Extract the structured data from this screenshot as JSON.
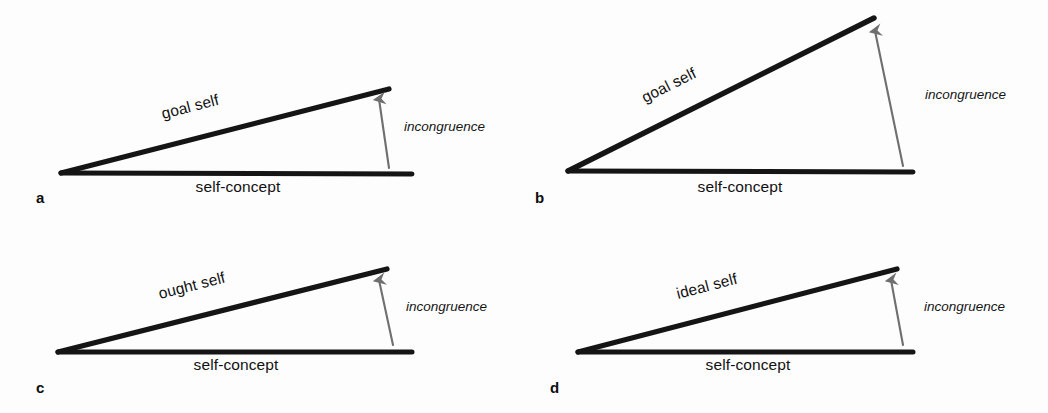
{
  "figure": {
    "background_color": "#fdfdfd",
    "line_color": "#151515",
    "arrow_color": "#6f6f6f",
    "text_color": "#111111"
  },
  "panels": [
    {
      "letter": "a",
      "upper_label": "goal self",
      "base_label": "self-concept",
      "arrow_label": "incongruence",
      "geometry": {
        "vertex": [
          61,
          173
        ],
        "apex": [
          389,
          89
        ],
        "base_right": [
          412,
          174
        ],
        "slope_deg": -14.4,
        "arrow_tail": [
          389,
          168
        ],
        "arrow_tip": [
          379,
          96
        ]
      },
      "letter_pos": [
        36,
        203
      ],
      "upper_label_pos": [
        163,
        119
      ],
      "base_label_pos": [
        238,
        192
      ],
      "arrow_label_pos": [
        404,
        131
      ]
    },
    {
      "letter": "b",
      "upper_label": "goal self",
      "base_label": "self-concept",
      "arrow_label": "incongruence",
      "geometry": {
        "vertex": [
          568,
          171
        ],
        "apex": [
          874,
          18
        ],
        "base_right": [
          913,
          172
        ],
        "slope_deg": -26.6,
        "arrow_tail": [
          903,
          166
        ],
        "arrow_tip": [
          874,
          27
        ]
      },
      "letter_pos": [
        535,
        203
      ],
      "upper_label_pos": [
        645,
        103
      ],
      "base_label_pos": [
        740,
        192
      ],
      "arrow_label_pos": [
        925,
        99
      ]
    },
    {
      "letter": "c",
      "upper_label": "ought self",
      "base_label": "self-concept",
      "arrow_label": "incongruence",
      "geometry": {
        "vertex": [
          58,
          352
        ],
        "apex": [
          387,
          269
        ],
        "base_right": [
          412,
          352
        ],
        "slope_deg": -14.2,
        "arrow_tail": [
          393,
          345
        ],
        "arrow_tip": [
          379,
          277
        ]
      },
      "letter_pos": [
        36,
        393
      ],
      "upper_label_pos": [
        160,
        299
      ],
      "base_label_pos": [
        236,
        370
      ],
      "arrow_label_pos": [
        406,
        311
      ]
    },
    {
      "letter": "d",
      "upper_label": "ideal self",
      "base_label": "self-concept",
      "arrow_label": "incongruence",
      "geometry": {
        "vertex": [
          578,
          352
        ],
        "apex": [
          897,
          269
        ],
        "base_right": [
          913,
          352
        ],
        "slope_deg": -14.6,
        "arrow_tail": [
          903,
          345
        ],
        "arrow_tip": [
          890,
          277
        ]
      },
      "letter_pos": [
        550,
        393
      ],
      "upper_label_pos": [
        678,
        299
      ],
      "base_label_pos": [
        748,
        370
      ],
      "arrow_label_pos": [
        924,
        311
      ]
    }
  ]
}
